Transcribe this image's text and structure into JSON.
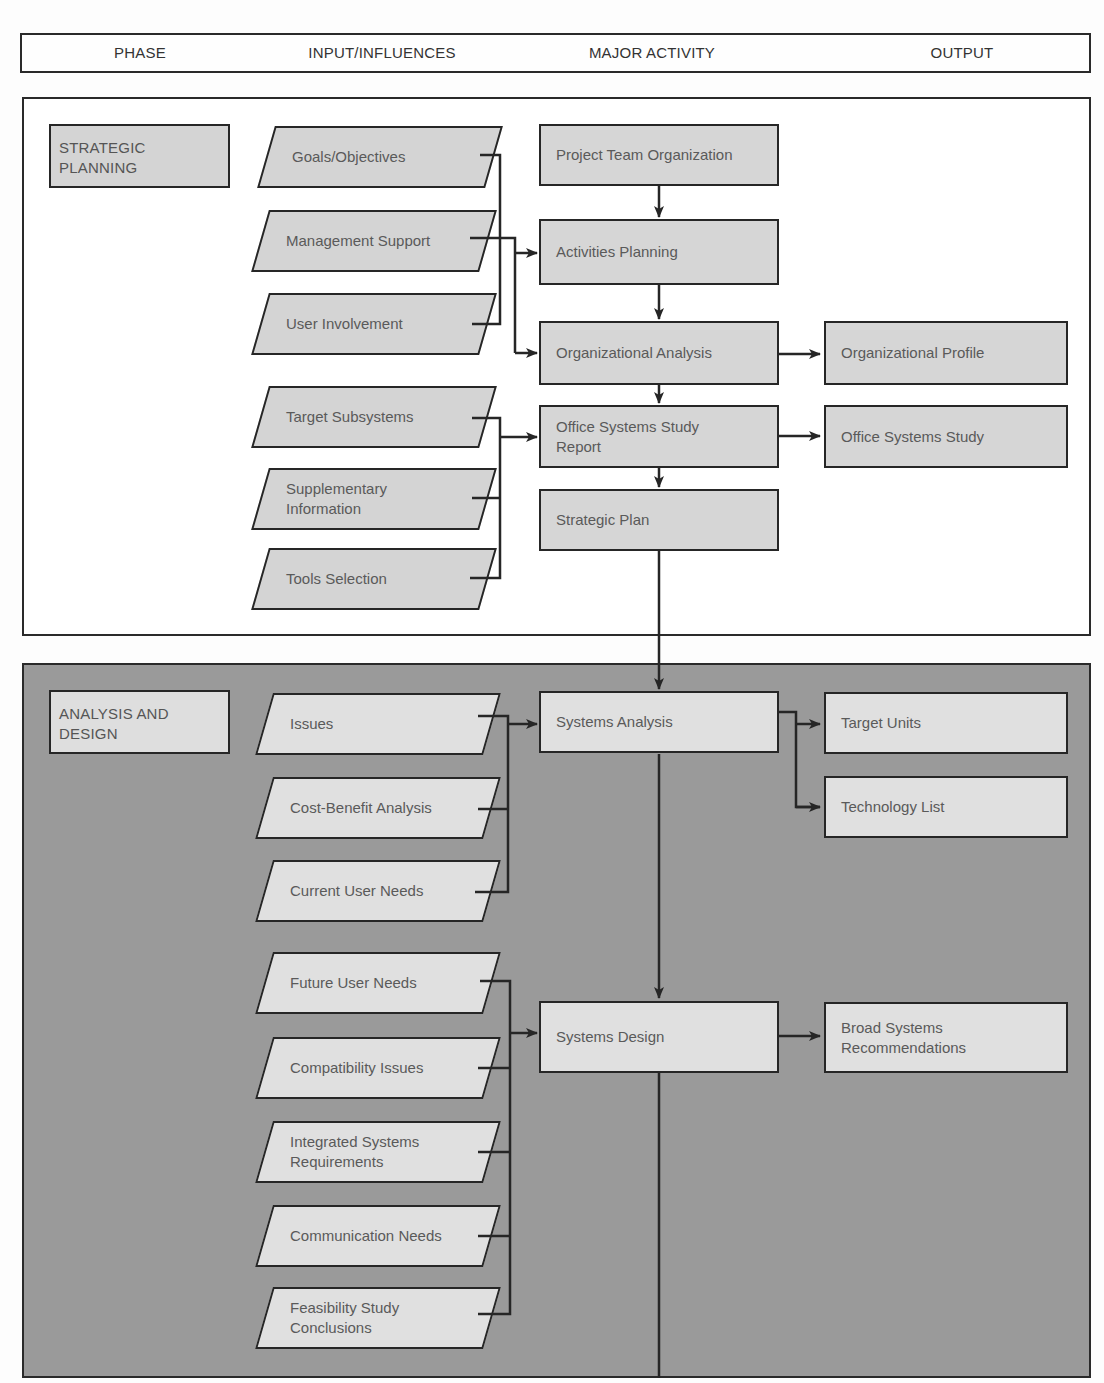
{
  "header": {
    "columns": [
      "PHASE",
      "INPUT/INFLUENCES",
      "MAJOR ACTIVITY",
      "OUTPUT"
    ]
  },
  "phases": [
    {
      "id": "strategic-planning",
      "label": "STRATEGIC\nPLANNING",
      "inputs": [
        "Goals/Objectives",
        "Management Support",
        "User Involvement",
        "Target Subsystems",
        "Supplementary\nInformation",
        "Tools Selection"
      ],
      "activities": [
        "Project Team Organization",
        "Activities Planning",
        "Organizational Analysis",
        "Office Systems Study\nReport",
        "Strategic Plan"
      ],
      "outputs": [
        "Organizational Profile",
        "Office Systems Study"
      ]
    },
    {
      "id": "analysis-and-design",
      "label": "ANALYSIS AND\nDESIGN",
      "inputs": [
        "Issues",
        "Cost-Benefit Analysis",
        "Current User Needs",
        "Future User Needs",
        "Compatibility Issues",
        "Integrated Systems\nRequirements",
        "Communication Needs",
        "Feasibility Study\nConclusions"
      ],
      "activities": [
        "Systems Analysis",
        "Systems Design"
      ],
      "outputs": [
        "Target Units",
        "Technology List",
        "Broad Systems\nRecommendations"
      ]
    }
  ],
  "colors": {
    "strategic_bg": "#ffffff",
    "analysis_bg": "#9a9a9a",
    "box_fill_light": "#d6d6d6",
    "box_fill_analysis": "#e0e0e0",
    "stroke": "#262626"
  }
}
